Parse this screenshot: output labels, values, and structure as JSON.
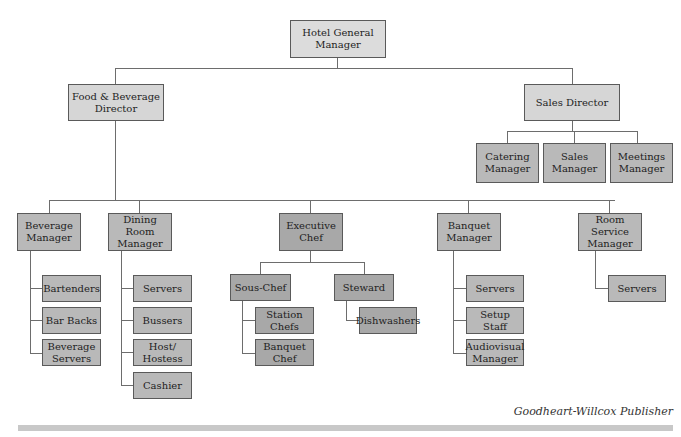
{
  "root": {
    "label": "Hotel General Manager"
  },
  "directors": [
    {
      "label": "Food & Beverage Director"
    },
    {
      "label": "Sales Director",
      "reports": [
        "Catering Manager",
        "Sales Manager",
        "Meetings Manager"
      ]
    }
  ],
  "fb_departments": [
    {
      "label": "Beverage Manager",
      "reports": [
        "Bartenders",
        "Bar Backs",
        "Beverage Servers"
      ]
    },
    {
      "label": "Dining Room Manager",
      "reports": [
        "Servers",
        "Bussers",
        "Host/ Hostess",
        "Cashier"
      ]
    },
    {
      "label": "Executive Chef",
      "subs": [
        {
          "label": "Sous-Chef",
          "reports": [
            "Station Chefs",
            "Banquet Chef"
          ]
        },
        {
          "label": "Steward",
          "reports": [
            "Dishwashers"
          ]
        }
      ]
    },
    {
      "label": "Banquet Manager",
      "reports": [
        "Servers",
        "Setup Staff",
        "Audiovisual Manager"
      ]
    },
    {
      "label": "Room Service Manager",
      "reports": [
        "Servers"
      ]
    }
  ],
  "credit": "Goodheart-Willcox Publisher",
  "colors": {
    "top_box": "#dcdcdc",
    "manager_box": "#b9b9b9",
    "kitchen_box": "#a8a8a8",
    "line": "#6d6d6d"
  }
}
